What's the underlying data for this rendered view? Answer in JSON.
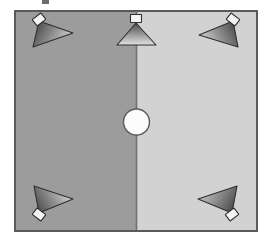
{
  "canvas": {
    "width": 269,
    "height": 242,
    "background": "#ffffff"
  },
  "diagram": {
    "type": "floor-plan-sensor-coverage",
    "title": "",
    "room": {
      "label": "room-outline",
      "x": 14,
      "y": 10,
      "width": 244,
      "height": 222,
      "border_color": "#5a5a5a",
      "border_width": 2
    },
    "zones": [
      {
        "name": "left-zone",
        "label": "",
        "x": 15,
        "y": 11,
        "width": 121,
        "height": 220,
        "fill": "#9c9c9c"
      },
      {
        "name": "right-zone",
        "label": "",
        "x": 137,
        "y": 11,
        "width": 120,
        "height": 220,
        "fill": "#d2d2d2"
      }
    ],
    "divider": {
      "name": "center-divider-line",
      "x": 136.5,
      "y1": 11,
      "y2": 231,
      "color": "#6f6f6f",
      "width": 1.6
    },
    "center_object": {
      "name": "center-circle",
      "label": "",
      "cx": 136.5,
      "cy": 122,
      "r": 13,
      "fill": "#fcfcfc",
      "stroke": "#5a5a5a",
      "stroke_width": 1.4
    },
    "sensors": [
      {
        "name": "sensor-top-left",
        "label": "",
        "apex": {
          "x": 39,
          "y": 21
        },
        "spread_a": {
          "x": 33,
          "y": 47
        },
        "spread_b": {
          "x": 73,
          "y": 33
        },
        "mount": {
          "cx": 39,
          "cy": 20,
          "w": 11,
          "h": 8,
          "rotate": -38
        },
        "gradient_from": "#3c3c3c",
        "gradient_to": "#c9c9c9",
        "outline": "#2e2e2e"
      },
      {
        "name": "sensor-top-center",
        "label": "",
        "apex": {
          "x": 136,
          "y": 23
        },
        "spread_a": {
          "x": 118,
          "y": 44
        },
        "spread_b": {
          "x": 156,
          "y": 44
        },
        "mount": {
          "cx": 136,
          "cy": 19,
          "w": 11,
          "h": 8,
          "rotate": 0
        },
        "gradient_from": "#4a4a4a",
        "gradient_to": "#e2e2e2",
        "outline": "#2e2e2e"
      },
      {
        "name": "sensor-top-right",
        "label": "",
        "apex": {
          "x": 233,
          "y": 21
        },
        "spread_a": {
          "x": 199,
          "y": 35
        },
        "spread_b": {
          "x": 238,
          "y": 47
        },
        "mount": {
          "cx": 233,
          "cy": 20,
          "w": 11,
          "h": 8,
          "rotate": 38
        },
        "gradient_from": "#3c3c3c",
        "gradient_to": "#c9c9c9",
        "outline": "#2e2e2e"
      },
      {
        "name": "sensor-bottom-left",
        "label": "",
        "apex": {
          "x": 39,
          "y": 213
        },
        "spread_a": {
          "x": 34,
          "y": 186
        },
        "spread_b": {
          "x": 73,
          "y": 199
        },
        "mount": {
          "cx": 39,
          "cy": 214,
          "w": 11,
          "h": 8,
          "rotate": 38
        },
        "gradient_from": "#3c3c3c",
        "gradient_to": "#cccccc",
        "outline": "#2e2e2e"
      },
      {
        "name": "sensor-bottom-right",
        "label": "",
        "apex": {
          "x": 232,
          "y": 213
        },
        "spread_a": {
          "x": 198,
          "y": 199
        },
        "spread_b": {
          "x": 237,
          "y": 186
        },
        "mount": {
          "cx": 232,
          "cy": 214,
          "w": 11,
          "h": 8,
          "rotate": -38
        },
        "gradient_from": "#3c3c3c",
        "gradient_to": "#bdbdbd",
        "outline": "#2e2e2e"
      }
    ],
    "top_artifact": {
      "name": "cropped-top-marker",
      "x": 42,
      "y": 0,
      "width": 7,
      "height": 4,
      "fill": "#6d6d6d"
    }
  }
}
